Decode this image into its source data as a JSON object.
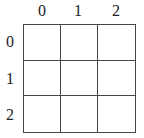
{
  "grid": {
    "rows": 3,
    "cols": 3,
    "column_labels": [
      "0",
      "1",
      "2"
    ],
    "row_labels": [
      "0",
      "1",
      "2"
    ],
    "line_color": "#444444",
    "cells": [
      [
        "",
        "",
        ""
      ],
      [
        "",
        "",
        ""
      ],
      [
        "",
        "",
        ""
      ]
    ]
  }
}
